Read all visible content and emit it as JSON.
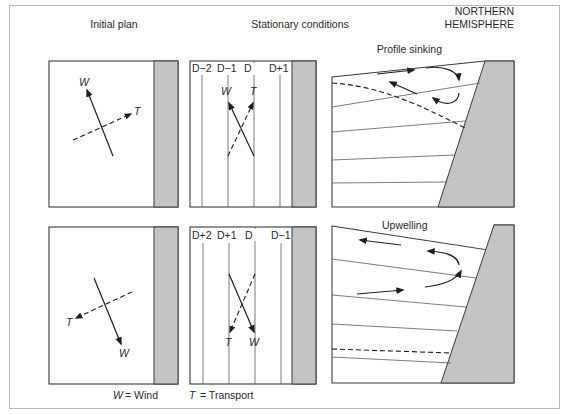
{
  "headers": {
    "initial_plan": "Initial plan",
    "stationary": "Stationary conditions",
    "hemisphere_line1": "NORTHERN",
    "hemisphere_line2": "HEMISPHERE"
  },
  "top_row": {
    "wind_label": "W",
    "transport_label": "T",
    "depth_labels": [
      "D−2",
      "D−1",
      "D",
      "D+1"
    ],
    "profile_title": "Profile sinking"
  },
  "bottom_row": {
    "wind_label": "W",
    "transport_label": "T",
    "depth_labels": [
      "D+2",
      "D+1",
      "D",
      "D−1"
    ],
    "profile_title": "Upwelling"
  },
  "legend": {
    "w_symbol": "W",
    "w_text": "= Wind",
    "t_symbol": "T",
    "t_text": "= Transport"
  },
  "colors": {
    "land": "#c4c4c4",
    "line": "#3a3a3a"
  }
}
